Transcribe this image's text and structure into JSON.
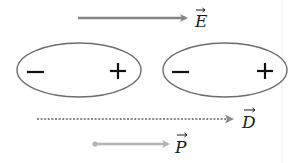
{
  "diagram": {
    "vectors": {
      "E": {
        "symbol": "E",
        "name": "electric field",
        "line_style": "solid",
        "color": "#858585",
        "direction": "right"
      },
      "D": {
        "symbol": "D",
        "name": "electric displacement",
        "line_style": "dotted",
        "color": "#8a8a8a",
        "direction": "right"
      },
      "P": {
        "symbol": "P",
        "name": "polarization",
        "line_style": "solid-with-tail-dot",
        "color": "#b3b3b3",
        "direction": "right"
      }
    },
    "dipoles": [
      {
        "negative_label": "−",
        "positive_label": "+"
      },
      {
        "negative_label": "−",
        "positive_label": "+"
      }
    ],
    "colors": {
      "ellipse_stroke": "#6e6e6e",
      "charge_sign": "#111111",
      "label": "#1a1a1a",
      "background": "#ffffff"
    }
  }
}
